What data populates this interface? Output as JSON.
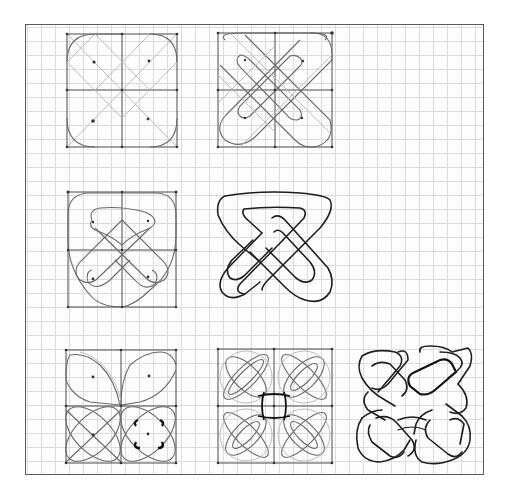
{
  "image": {
    "description": "Hand-drawn pencil and ink sketch on graph paper showing the step-by-step construction of a Celtic knot motif",
    "paper": {
      "type": "graph paper",
      "grid_color": "#dcdcdc",
      "border_color": "#5a5a5a"
    },
    "panels": [
      {
        "id": "step-1",
        "row": 1,
        "col": 1,
        "label": "Square divided into quadrants with diagonals, four rounded corner lobes and center dots"
      },
      {
        "id": "step-2",
        "row": 1,
        "col": 2,
        "label": "Diagonal bands crossing through the square forming an X of elongated loops"
      },
      {
        "id": "step-3",
        "row": 2,
        "col": 1,
        "label": "Pencil layout of interlaced triangular loop within gridded square"
      },
      {
        "id": "step-4",
        "row": 2,
        "col": 2,
        "label": "Inked single knot: rounded triangle interlaced with a pointed loop"
      },
      {
        "id": "step-5",
        "row": 3,
        "col": 1,
        "label": "2x2 grid of quadrants with petal/leaf shapes and ellipses"
      },
      {
        "id": "step-6",
        "row": 3,
        "col": 2,
        "label": "2x2 pencil layout of four interlaced knots"
      },
      {
        "id": "step-7",
        "row": 3,
        "col": 3,
        "label": "Inked final 2x2 Celtic knot panel"
      }
    ]
  }
}
